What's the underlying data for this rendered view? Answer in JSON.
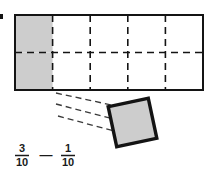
{
  "figure": {
    "colors": {
      "shade": "#cdcdcd",
      "stroke": "#141414",
      "background": "#ffffff",
      "text": "#1a1a1a"
    },
    "grid": {
      "name": "tenths-bar",
      "columns": 5,
      "rows": 2,
      "total_cells": 10,
      "shaded_cells": 2,
      "shaded_positions": [
        "row1-col1",
        "row2-col1"
      ],
      "outer_border_style": "solid",
      "inner_divider_style": "dashed",
      "x": 15,
      "y": 15,
      "width": 188,
      "height": 75
    },
    "detached_piece": {
      "name": "removed-tenth-square",
      "count": 1,
      "shaded": true,
      "rotation_degrees": -12,
      "x": 112,
      "y": 102,
      "size": 41,
      "border_style": "solid-thick"
    },
    "connector_lines": {
      "name": "pull-out-guides",
      "count": 3,
      "style": "dashed"
    },
    "expression": {
      "name": "fraction-expression",
      "plain_text": "3/10 - 1/10",
      "terms": [
        {
          "numerator": "3",
          "denominator": "10"
        },
        {
          "numerator": "1",
          "denominator": "10"
        }
      ],
      "operator": "—"
    }
  }
}
